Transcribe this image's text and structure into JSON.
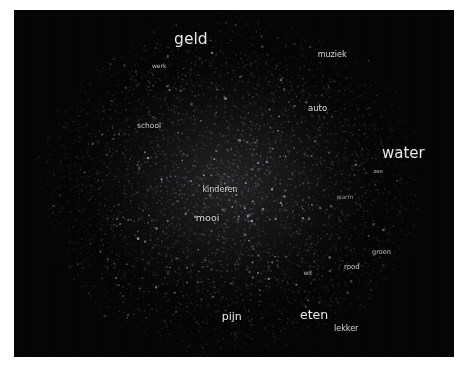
{
  "figure": {
    "background_color": "#ffffff",
    "plot_background_color": "#050505",
    "label_color": "#e8e8e8",
    "point_color": "#9a9ca0"
  },
  "chart_data": {
    "type": "scatter",
    "title": "",
    "subtitle": "",
    "xlabel": "",
    "ylabel": "",
    "xlim": [
      0,
      1
    ],
    "ylim": [
      0,
      1
    ],
    "grid": false,
    "legend": null,
    "axis_ticks_visible": false,
    "point_count_estimate": 6000,
    "annotations": [
      {
        "label": "geld",
        "x": 0.402,
        "y": 0.087,
        "font_size": 15.5,
        "opacity": 1.0
      },
      {
        "label": "werk",
        "x": 0.33,
        "y": 0.16,
        "font_size": 6.0,
        "opacity": 0.8
      },
      {
        "label": "muziek",
        "x": 0.723,
        "y": 0.13,
        "font_size": 8.0,
        "opacity": 0.92
      },
      {
        "label": "auto",
        "x": 0.69,
        "y": 0.283,
        "font_size": 8.5,
        "opacity": 0.95
      },
      {
        "label": "school",
        "x": 0.307,
        "y": 0.334,
        "font_size": 7.5,
        "opacity": 0.85
      },
      {
        "label": "water",
        "x": 0.885,
        "y": 0.412,
        "font_size": 15.0,
        "opacity": 1.0
      },
      {
        "label": "zee",
        "x": 0.828,
        "y": 0.468,
        "font_size": 5.5,
        "opacity": 0.72
      },
      {
        "label": "kinderen",
        "x": 0.468,
        "y": 0.518,
        "font_size": 8.0,
        "opacity": 0.92
      },
      {
        "label": "warm",
        "x": 0.752,
        "y": 0.538,
        "font_size": 6.0,
        "opacity": 0.62
      },
      {
        "label": "mooi",
        "x": 0.44,
        "y": 0.598,
        "font_size": 9.5,
        "opacity": 0.95
      },
      {
        "label": "groen",
        "x": 0.835,
        "y": 0.697,
        "font_size": 6.5,
        "opacity": 0.8
      },
      {
        "label": "rood",
        "x": 0.768,
        "y": 0.74,
        "font_size": 7.0,
        "opacity": 0.85
      },
      {
        "label": "wit",
        "x": 0.668,
        "y": 0.757,
        "font_size": 6.0,
        "opacity": 0.78
      },
      {
        "label": "pijn",
        "x": 0.495,
        "y": 0.883,
        "font_size": 11.0,
        "opacity": 1.0
      },
      {
        "label": "eten",
        "x": 0.682,
        "y": 0.878,
        "font_size": 12.5,
        "opacity": 1.0
      },
      {
        "label": "lekker",
        "x": 0.755,
        "y": 0.92,
        "font_size": 8.0,
        "opacity": 0.92
      }
    ]
  }
}
